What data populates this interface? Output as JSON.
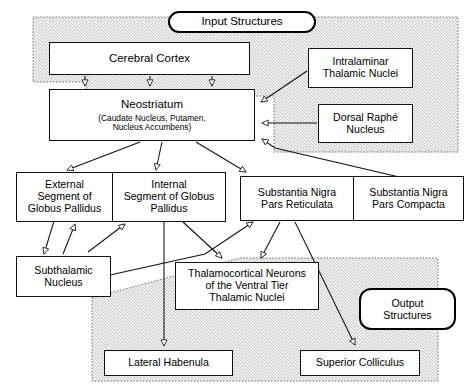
{
  "diagram": {
    "regions": [
      {
        "id": "input-region",
        "label": "Input Structures",
        "kind": "shaded-region"
      },
      {
        "id": "output-region",
        "label": "Output Structures",
        "kind": "shaded-region"
      }
    ],
    "labels": {
      "input_structures": "Input Structures",
      "output_structures": "Output Structures"
    },
    "nodes": [
      {
        "id": "cerebral-cortex",
        "lines": [
          "Cerebral Cortex"
        ]
      },
      {
        "id": "neostriatum",
        "lines": [
          "Neostriatum"
        ],
        "sublines": [
          "(Caudate Nucleus, Putamen,",
          "Nucleus Accumbens)"
        ]
      },
      {
        "id": "intralaminar-thalamic-nuclei",
        "lines": [
          "Intralaminar",
          "Thalamic Nuclei"
        ]
      },
      {
        "id": "dorsal-raphe-nucleus",
        "lines": [
          "Dorsal Raphé",
          "Nucleus"
        ]
      },
      {
        "id": "external-globus-pallidus",
        "lines": [
          "External",
          "Segment of",
          "Globus Pallidus"
        ]
      },
      {
        "id": "internal-globus-pallidus",
        "lines": [
          "Internal",
          "Segment of Globus",
          "Pallidus"
        ]
      },
      {
        "id": "substantia-nigra-pars-reticulata",
        "lines": [
          "Substantia Nigra",
          "Pars Reticulata"
        ]
      },
      {
        "id": "substantia-nigra-pars-compacta",
        "lines": [
          "Substantia Nigra",
          "Pars Compacta"
        ]
      },
      {
        "id": "subthalamic-nucleus",
        "lines": [
          "Subthalamic",
          "Nucleus"
        ]
      },
      {
        "id": "thalamocortical-neurons",
        "lines": [
          "Thalamocortical Neurons",
          "of the Ventral Tier",
          "Thalamic Nuclei"
        ]
      },
      {
        "id": "lateral-habenula",
        "lines": [
          "Lateral Habenula"
        ]
      },
      {
        "id": "superior-colliculus",
        "lines": [
          "Superior Colliculus"
        ]
      }
    ],
    "text": {
      "cerebral_cortex": "Cerebral Cortex",
      "neostriatum": "Neostriatum",
      "neostriatum_sub1": "(Caudate Nucleus, Putamen,",
      "neostriatum_sub2": "Nucleus Accumbens)",
      "intralaminar_1": "Intralaminar",
      "intralaminar_2": "Thalamic Nuclei",
      "raphe_1": "Dorsal Raphé",
      "raphe_2": "Nucleus",
      "gpe_1": "External",
      "gpe_2": "Segment of",
      "gpe_3": "Globus Pallidus",
      "gpi_1": "Internal",
      "gpi_2": "Segment of Globus",
      "gpi_3": "Pallidus",
      "snr_1": "Substantia Nigra",
      "snr_2": "Pars Reticulata",
      "snc_1": "Substantia Nigra",
      "snc_2": "Pars Compacta",
      "stn_1": "Subthalamic",
      "stn_2": "Nucleus",
      "tc_1": "Thalamocortical Neurons",
      "tc_2": "of the Ventral Tier",
      "tc_3": "Thalamic Nuclei",
      "lateral_habenula": "Lateral Habenula",
      "superior_colliculus": "Superior Colliculus",
      "output_1": "Output",
      "output_2": "Structures"
    },
    "colors": {
      "line": "#111111",
      "box_fill": "#ffffff",
      "region_fill": "#e2e2e2",
      "region_border": "#6b6b6b"
    }
  }
}
